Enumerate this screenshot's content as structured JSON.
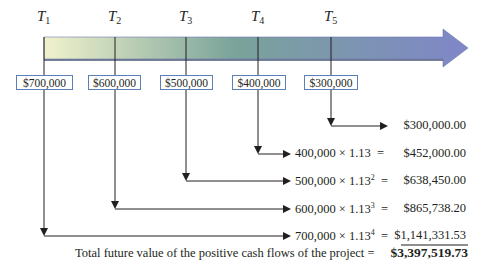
{
  "timeline": {
    "periods": [
      {
        "label": "T",
        "sub": "1"
      },
      {
        "label": "T",
        "sub": "2"
      },
      {
        "label": "T",
        "sub": "3"
      },
      {
        "label": "T",
        "sub": "4"
      },
      {
        "label": "T",
        "sub": "5"
      }
    ],
    "cash_flows": [
      "$700,000",
      "$600,000",
      "$500,000",
      "$400,000",
      "$300,000"
    ],
    "gradient_colors": {
      "start": "#eef0c8",
      "middle": "#6f9a92",
      "end": "#7f86c6"
    }
  },
  "calculations": [
    {
      "base": "",
      "rate": "",
      "exp": "",
      "eq": "",
      "value": "$300,000.00"
    },
    {
      "base": "400,000",
      "rate": "× 1.13",
      "exp": "",
      "eq": "=",
      "value": "$452,000.00"
    },
    {
      "base": "500,000",
      "rate": "× 1.13",
      "exp": "2",
      "eq": "=",
      "value": "$638,450.00"
    },
    {
      "base": "600,000",
      "rate": "× 1.13",
      "exp": "3",
      "eq": "=",
      "value": "$865,738.20"
    },
    {
      "base": "700,000",
      "rate": "× 1.13",
      "exp": "4",
      "eq": "=",
      "value": "$1,141,331.53"
    }
  ],
  "total": {
    "label": "Total future value of the positive cash flows of the project  =",
    "value": "$3,397,519.73"
  }
}
